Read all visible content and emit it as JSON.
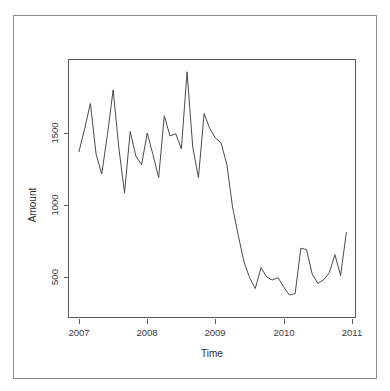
{
  "figure": {
    "background": "#ffffff",
    "frame_color": "#8d8d8d",
    "axis_color": "#5a5a5a",
    "line_color": "#4a4a4a"
  },
  "axes": {
    "x_title": "Time",
    "y_title": "Amount",
    "x_ticks": [
      "2007",
      "2008",
      "2009",
      "2010",
      "2011"
    ],
    "y_ticks": [
      "500",
      "1000",
      "1500"
    ]
  },
  "chart_data": {
    "type": "line",
    "title": "",
    "subtitle": "",
    "xlabel": "Time",
    "ylabel": "Amount",
    "xlim": [
      2007.0,
      2011.0
    ],
    "ylim": [
      330,
      1960
    ],
    "xtick_values": [
      2007,
      2008,
      2009,
      2010,
      2011
    ],
    "xtick_labels": [
      "2007",
      "2008",
      "2009",
      "2010",
      "2011"
    ],
    "ytick_values": [
      500,
      1000,
      1500
    ],
    "ytick_labels": [
      "500",
      "1000",
      "1500"
    ],
    "grid": false,
    "legend": null,
    "legend_position": "none",
    "annotations": [],
    "series": [
      {
        "name": "Amount",
        "color": "#4a4a4a",
        "x": [
          2007.0,
          2007.083,
          2007.167,
          2007.25,
          2007.333,
          2007.417,
          2007.5,
          2007.583,
          2007.667,
          2007.75,
          2007.833,
          2007.917,
          2008.0,
          2008.083,
          2008.167,
          2008.25,
          2008.333,
          2008.417,
          2008.5,
          2008.583,
          2008.667,
          2008.75,
          2008.833,
          2008.917,
          2009.0,
          2009.083,
          2009.167,
          2009.25,
          2009.333,
          2009.417,
          2009.5,
          2009.583,
          2009.667,
          2009.75,
          2009.833,
          2009.917,
          2010.0,
          2010.083,
          2010.167,
          2010.25,
          2010.333,
          2010.417,
          2010.5,
          2010.583,
          2010.667,
          2010.75,
          2010.833,
          2010.917
        ],
        "y": [
          1370,
          1530,
          1705,
          1355,
          1215,
          1490,
          1800,
          1400,
          1085,
          1510,
          1340,
          1280,
          1500,
          1350,
          1190,
          1620,
          1480,
          1495,
          1390,
          1925,
          1400,
          1190,
          1635,
          1530,
          1465,
          1430,
          1280,
          985,
          790,
          605,
          495,
          420,
          565,
          500,
          480,
          495,
          430,
          375,
          385,
          380,
          520,
          415,
          555,
          700,
          815,
          700,
          690,
          680
        ]
      }
    ]
  },
  "chart_data_tail": {
    "x": [
      2010.25,
      2010.333,
      2010.417,
      2010.5,
      2010.583,
      2010.667,
      2010.75,
      2010.833,
      2010.917
    ],
    "y": [
      700,
      690,
      520,
      455,
      480,
      530,
      655,
      510,
      810
    ]
  }
}
